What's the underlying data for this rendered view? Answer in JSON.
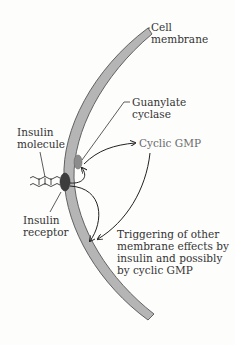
{
  "labels": {
    "cell_membrane": "Cell\nmembrane",
    "guanylate_cyclase": "Guanylate\ncyclase",
    "cyclic_gmp": "Cyclic GMP",
    "insulin_molecule": "Insulin\nmolecule",
    "insulin_receptor": "Insulin\nreceptor",
    "triggering": "Triggering of other\nmembrane effects by\ninsulin and possibly\nby cyclic GMP"
  },
  "colors": {
    "membrane_fill": "#b5b5b5",
    "membrane_edge": "#555555",
    "receptor": "#3d3d3d",
    "guanylate_cyclase": "#8c8c8c",
    "arrow": "#222222",
    "text": "#333333"
  },
  "icons": {
    "insulin_molecule": "wavy-chain-icon",
    "receptor": "dark-oval",
    "cyclase": "gray-oval"
  }
}
